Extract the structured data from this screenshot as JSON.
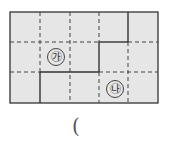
{
  "diagram": {
    "type": "grid-figure",
    "grid": {
      "cols": 5,
      "rows": 3,
      "left": 10,
      "top": 12,
      "cell_w": 29.6,
      "cell_h": 30.3,
      "fill": "#e6e6e6",
      "line_color": "#333333"
    },
    "solid_segments": [
      {
        "x1": 128,
        "y1": 12,
        "x2": 128,
        "y2": 42
      },
      {
        "x1": 99,
        "y1": 42,
        "x2": 128,
        "y2": 42
      },
      {
        "x1": 99,
        "y1": 42,
        "x2": 99,
        "y2": 72
      },
      {
        "x1": 40,
        "y1": 72,
        "x2": 99,
        "y2": 72
      },
      {
        "x1": 40,
        "y1": 72,
        "x2": 40,
        "y2": 103
      }
    ],
    "labels": [
      {
        "id": "ga",
        "text": "㉮",
        "col": 1,
        "row": 1
      },
      {
        "id": "na",
        "text": "㉯",
        "col": 3,
        "row": 2
      }
    ]
  },
  "answer_paren": "("
}
